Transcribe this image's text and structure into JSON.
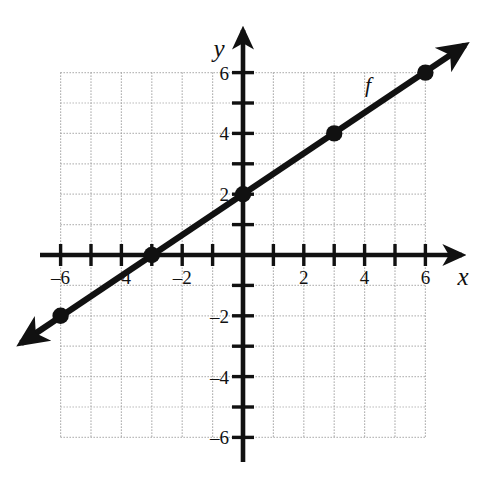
{
  "figure": {
    "title": "",
    "background_color": "#ffffff",
    "ink_color": "#111111",
    "grid_color": "#9a9a9a"
  },
  "axes": {
    "x_label": "x",
    "y_label": "y",
    "x_ticks": [
      -6,
      -5,
      -4,
      -3,
      -2,
      -1,
      1,
      2,
      3,
      4,
      5,
      6
    ],
    "y_ticks": [
      -6,
      -5,
      -4,
      -3,
      -2,
      -1,
      1,
      2,
      3,
      4,
      5,
      6
    ],
    "x_tick_labels": [
      {
        "value": -6,
        "text": "-6"
      },
      {
        "value": -4,
        "text": "-4"
      },
      {
        "value": -2,
        "text": "-2"
      },
      {
        "value": 2,
        "text": "2"
      },
      {
        "value": 4,
        "text": "4"
      },
      {
        "value": 6,
        "text": "6"
      }
    ],
    "y_tick_labels": [
      {
        "value": 6,
        "text": "6"
      },
      {
        "value": 4,
        "text": "4"
      },
      {
        "value": 2,
        "text": "2"
      },
      {
        "value": -2,
        "text": "-2"
      },
      {
        "value": -4,
        "text": "-4"
      },
      {
        "value": -6,
        "text": "-6"
      }
    ],
    "x_range": [
      -6,
      6
    ],
    "y_range": [
      -6,
      6
    ],
    "grid": true,
    "grid_style": "dotted",
    "grid_step": 1,
    "arrows": [
      "x-positive",
      "y-positive"
    ]
  },
  "chart_data": {
    "type": "line",
    "title": "",
    "xlabel": "x",
    "ylabel": "y",
    "xlim": [
      -6,
      6
    ],
    "ylim": [
      -6,
      6
    ],
    "grid": true,
    "legend": "none",
    "series": [
      {
        "name": "f",
        "label": "f",
        "label_position": {
          "x": 4.05,
          "y": 5.3
        },
        "equation": "y = (2/3)x + 2",
        "slope": 0.6667,
        "intercept": 2,
        "x_intercept": -3,
        "line_endpoints": [
          {
            "x": -7.3,
            "y": -2.9
          },
          {
            "x": 7.3,
            "y": 6.9
          }
        ],
        "arrow_both_ends": true,
        "points": [
          {
            "x": -6,
            "y": -2
          },
          {
            "x": -3,
            "y": 0
          },
          {
            "x": 0,
            "y": 2
          },
          {
            "x": 3,
            "y": 4
          },
          {
            "x": 6,
            "y": 6
          }
        ]
      }
    ]
  }
}
